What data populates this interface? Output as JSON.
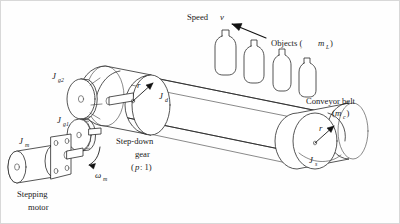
{
  "figure": {
    "background_color": "#fefefe",
    "line_color": "#2a2a2a",
    "border_color": "#d8d8d8"
  },
  "labels": {
    "speed": {
      "text": "Speed",
      "symbol": "v"
    },
    "objects": {
      "text": "Objects (",
      "symbol": "m",
      "subscript": "L",
      "close": ")"
    },
    "conveyor_belt": {
      "line1": "Conveyor belt",
      "open": "(",
      "symbol": "m",
      "subscript": "c",
      "close": ")"
    },
    "step_down_gear": {
      "line1": "Step-down",
      "line2": "gear",
      "ratio_open": "(",
      "ratio_symbol": "p",
      "ratio_rest": " : 1)"
    },
    "stepping_motor": {
      "line1": "Stepping",
      "line2": "motor"
    },
    "omega_m": {
      "symbol": "ω",
      "subscript": "m"
    },
    "inertia_motor": {
      "symbol": "J",
      "subscript": "m"
    },
    "inertia_gear1": {
      "symbol": "J",
      "subscript": "g1"
    },
    "inertia_gear2": {
      "symbol": "J",
      "subscript": "g2"
    },
    "inertia_drive_drum": {
      "symbol": "J",
      "subscript": "d"
    },
    "inertia_idler_roller": {
      "symbol": "J",
      "subscript": "s"
    },
    "radius_drive": {
      "symbol": "r"
    },
    "radius_idler": {
      "symbol": "r"
    }
  },
  "components": {
    "objects_count": 4,
    "object_shape": "bottle",
    "gear_pair": {
      "driver": "small lower gear",
      "driven": "large upper gear"
    },
    "rollers": [
      "drive drum (left)",
      "idler roller (right)"
    ],
    "motor_shape": "cylindrical stepping motor with mounting flange"
  },
  "arrows": {
    "speed_direction": "leftward along belt",
    "omega_direction": "counterclockwise about motor shaft",
    "radius_arrows": 2
  }
}
